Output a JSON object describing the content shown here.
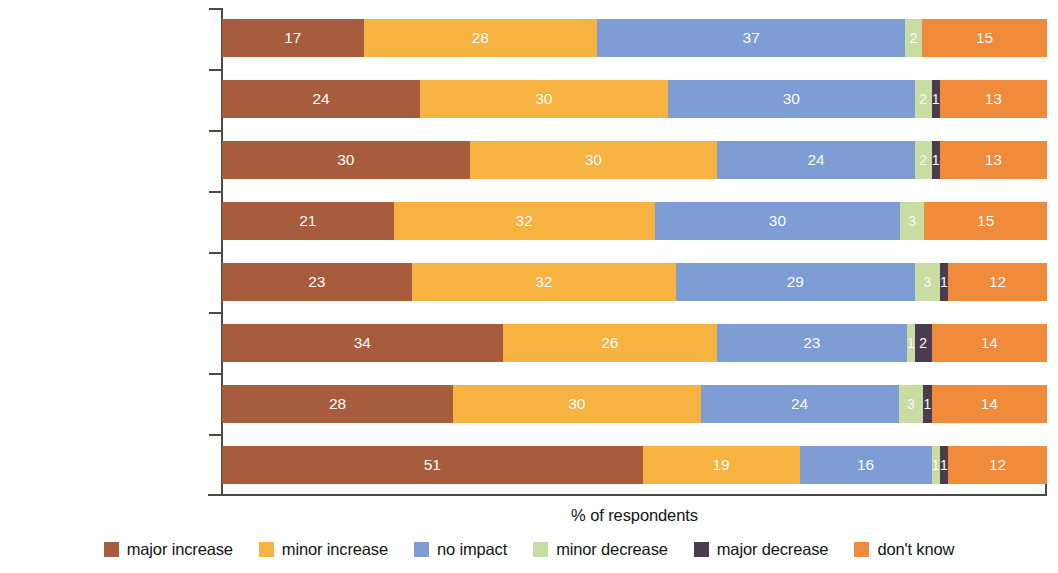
{
  "chart_data": {
    "type": "bar",
    "subtype": "horizontal-stacked-100",
    "title": "",
    "xlabel": "% of respondents",
    "ylabel": "",
    "xlim": [
      0,
      100
    ],
    "grid": false,
    "legend_position": "bottom",
    "categories": [
      "transfer and convertability\nrestrictions",
      "breach of contract",
      "nonhonoring of\ngovernment guarantees",
      "expropriation/\nnationalization",
      "adverse regulatory\nchanges",
      "war",
      "terrorism",
      "civil disturbance"
    ],
    "series": [
      {
        "name": "major increase",
        "color": "#A85C3E",
        "values": [
          17,
          24,
          30,
          21,
          23,
          34,
          28,
          51
        ]
      },
      {
        "name": "minor increase",
        "color": "#F6B342",
        "values": [
          28,
          30,
          30,
          32,
          32,
          26,
          30,
          19
        ]
      },
      {
        "name": "no impact",
        "color": "#7E9DD4",
        "values": [
          37,
          30,
          24,
          30,
          29,
          23,
          24,
          16
        ]
      },
      {
        "name": "minor decrease",
        "color": "#C9DDA3",
        "values": [
          2,
          2,
          2,
          3,
          3,
          1,
          3,
          1
        ]
      },
      {
        "name": "major decrease",
        "color": "#4A3C4E",
        "values": [
          0,
          1,
          1,
          0,
          1,
          2,
          1,
          1
        ]
      },
      {
        "name": "don't know",
        "color": "#F08B3C",
        "values": [
          15,
          13,
          13,
          15,
          12,
          14,
          14,
          12
        ]
      }
    ]
  },
  "legend": {
    "items": [
      {
        "label": "major increase",
        "color": "#A85C3E"
      },
      {
        "label": "minor increase",
        "color": "#F6B342"
      },
      {
        "label": "no impact",
        "color": "#7E9DD4"
      },
      {
        "label": "minor decrease",
        "color": "#C9DDA3"
      },
      {
        "label": "major decrease",
        "color": "#4A3C4E"
      },
      {
        "label": "don't know",
        "color": "#F08B3C"
      }
    ]
  },
  "axis": {
    "x_title": "% of respondents"
  }
}
